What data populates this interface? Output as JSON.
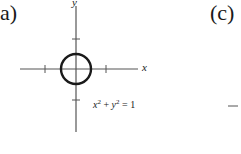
{
  "panels": [
    {
      "label": "a)",
      "axes": {
        "x_label": "x",
        "y_label": "y"
      },
      "equation": {
        "lhs_x": "x",
        "lhs_y": "y",
        "exp": "2",
        "plus": " + ",
        "rhs": " = 1"
      },
      "shape": "circle"
    },
    {
      "label": "(c)"
    }
  ],
  "colors": {
    "ink": "#1a1a1a",
    "axis": "#555555"
  }
}
